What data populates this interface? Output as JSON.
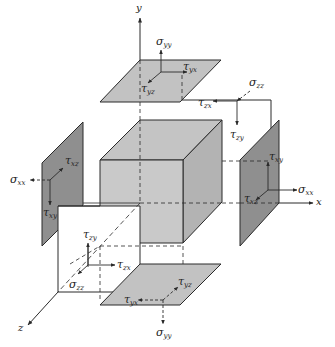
{
  "figure": {
    "type": "stress-element-exploded-view",
    "colors": {
      "line": "#2a2a2a",
      "cube_front": "#c9c9c9",
      "cube_top": "#c4c4c4",
      "cube_side": "#b3b3b3",
      "plane_light": "#c2c2c2",
      "plane_dark": "#8f8f8f",
      "background": "#ffffff"
    },
    "axes": {
      "x": {
        "label": "x"
      },
      "y": {
        "label": "y"
      },
      "z": {
        "label": "z"
      }
    },
    "faces": {
      "top_y_positive": {
        "labels": [
          {
            "sym": "σ",
            "sub": "yy"
          },
          {
            "sym": "τ",
            "sub": "yx"
          },
          {
            "sym": "τ",
            "sub": "yz"
          }
        ]
      },
      "back_z_negative": {
        "labels": [
          {
            "sym": "σ",
            "sub": "zz"
          },
          {
            "sym": "τ",
            "sub": "zx"
          },
          {
            "sym": "τ",
            "sub": "zy"
          }
        ]
      },
      "right_x_positive": {
        "labels": [
          {
            "sym": "τ",
            "sub": "xy"
          },
          {
            "sym": "σ",
            "sub": "xx"
          },
          {
            "sym": "τ",
            "sub": "xz"
          }
        ]
      },
      "left_x_negative": {
        "labels": [
          {
            "sym": "σ",
            "sub": "xx"
          },
          {
            "sym": "τ",
            "sub": "xz"
          },
          {
            "sym": "τ",
            "sub": "xy"
          }
        ]
      },
      "front_z_positive": {
        "labels": [
          {
            "sym": "τ",
            "sub": "zy"
          },
          {
            "sym": "τ",
            "sub": "zx"
          },
          {
            "sym": "σ",
            "sub": "zz"
          }
        ]
      },
      "bottom_y_negative": {
        "labels": [
          {
            "sym": "τ",
            "sub": "yz"
          },
          {
            "sym": "τ",
            "sub": "yx"
          },
          {
            "sym": "σ",
            "sub": "yy"
          }
        ]
      }
    }
  }
}
